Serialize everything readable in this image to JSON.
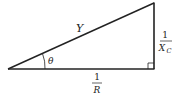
{
  "diagram": {
    "type": "right-triangle",
    "labels": {
      "hypotenuse": "Y",
      "angle": "θ",
      "vertical_numerator": "1",
      "vertical_denominator_main": "X",
      "vertical_denominator_sub": "C",
      "horizontal_numerator": "1",
      "horizontal_denominator": "R"
    },
    "vertices": {
      "left": [
        8,
        69
      ],
      "bottom_right": [
        154,
        69
      ],
      "top_right": [
        154,
        3
      ]
    },
    "colors": {
      "stroke": "#222222",
      "background": "#ffffff"
    }
  }
}
